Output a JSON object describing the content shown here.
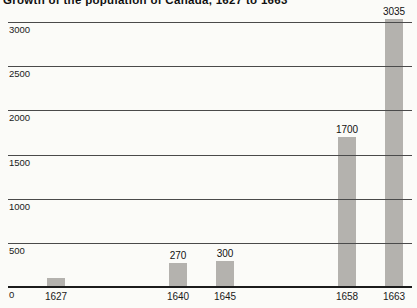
{
  "chart_data": {
    "type": "bar",
    "title": "Growth of the population of Canada, 1627 to 1663",
    "xlabel": "",
    "ylabel": "",
    "categories": [
      "1627",
      "1640",
      "1645",
      "1658",
      "1663"
    ],
    "values": [
      100,
      270,
      300,
      1700,
      3035
    ],
    "bar_labels": [
      "",
      "270",
      "300",
      "1700",
      "3035"
    ],
    "yticks": [
      0,
      500,
      1000,
      1500,
      2000,
      2500,
      3000
    ],
    "ylim": [
      0,
      3000
    ],
    "grid": true,
    "legend": "none",
    "x_axis_scale": "linear-by-year",
    "note_unlabeled_first_bar": "1627 bar has no printed value; height implies approx. 100",
    "colors": {
      "background": "#fbfbf8",
      "bar": "#b4b2ae",
      "gridline": "#4a4a4a",
      "baseline": "#1c1c1c",
      "text": "#1a1a1a"
    }
  }
}
